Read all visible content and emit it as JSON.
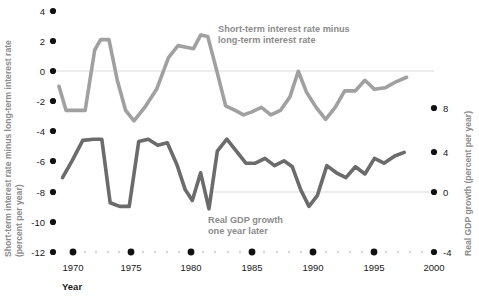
{
  "chart_data": {
    "type": "line",
    "title": "",
    "xlabel": "Year",
    "ylabel_left": "Short-term interest rate minus long-term interest rate (percent per year)",
    "ylabel_right": "Real GDP growth (percent per year)",
    "xlim": [
      1968.5,
      2000.5
    ],
    "xticks": [
      1970,
      1975,
      1980,
      1985,
      1990,
      1995,
      2000
    ],
    "xtick_labels": [
      "1970",
      "1975",
      "1980",
      "1985",
      "1990",
      "1995",
      "2000"
    ],
    "yticks_left": [
      4,
      2,
      0,
      -2,
      -4,
      -6,
      -8,
      -10,
      -12
    ],
    "ytick_labels_left": [
      "4",
      "2",
      "0",
      "-2",
      "-4",
      "-6",
      "-8",
      "-10",
      "-12"
    ],
    "ylim_left": [
      -12,
      4
    ],
    "yticks_right": [
      8,
      4,
      0,
      -4
    ],
    "ytick_labels_right": [
      "8",
      "4",
      "0",
      "-4"
    ],
    "ylim_right": [
      -4,
      8
    ],
    "grid": false,
    "zero_lines": [
      0,
      -8
    ],
    "legend_position": "inline-annotation",
    "series": [
      {
        "name": "Short-term interest rate minus long-term interest rate",
        "axis": "left",
        "color": "#a0a0a0",
        "x": [
          1969.0,
          1969.6,
          1970.4,
          1971.2,
          1972.0,
          1972.5,
          1973.2,
          1973.9,
          1974.6,
          1975.3,
          1976.2,
          1977.2,
          1978.2,
          1979.0,
          1979.7,
          1980.3,
          1980.9,
          1981.5,
          1982.2,
          1983.0,
          1983.8,
          1984.5,
          1985.2,
          1986.0,
          1986.8,
          1987.6,
          1988.4,
          1989.1,
          1989.8,
          1990.6,
          1991.4,
          1992.2,
          1993.0,
          1993.9,
          1994.7,
          1995.5,
          1996.4,
          1997.3,
          1998.2
        ],
        "y": [
          -1.0,
          -2.6,
          -2.6,
          -2.6,
          1.4,
          2.1,
          2.1,
          -0.6,
          -2.6,
          -3.3,
          -2.4,
          -1.2,
          0.9,
          1.7,
          1.6,
          1.5,
          2.4,
          2.3,
          0.2,
          -2.3,
          -2.6,
          -2.9,
          -2.7,
          -2.4,
          -2.9,
          -2.6,
          -1.7,
          0.0,
          -1.4,
          -2.4,
          -3.2,
          -2.4,
          -1.3,
          -1.3,
          -0.6,
          -1.2,
          -1.1,
          -0.7,
          -0.4
        ]
      },
      {
        "name": "Real GDP growth one year later",
        "axis": "right",
        "color": "#6b6b6b",
        "x": [
          1969.3,
          1970.1,
          1971.0,
          1971.9,
          1972.6,
          1973.3,
          1974.1,
          1974.9,
          1975.7,
          1976.5,
          1977.3,
          1978.1,
          1978.9,
          1979.6,
          1980.2,
          1980.9,
          1981.6,
          1982.3,
          1983.1,
          1983.9,
          1984.7,
          1985.5,
          1986.3,
          1987.1,
          1987.9,
          1988.6,
          1989.3,
          1990.0,
          1990.7,
          1991.5,
          1992.3,
          1993.1,
          1993.9,
          1994.7,
          1995.5,
          1996.3,
          1997.2,
          1998.0
        ],
        "y": [
          2.2,
          3.6,
          5.3,
          5.4,
          5.4,
          0.1,
          -0.2,
          -0.2,
          5.2,
          5.4,
          4.9,
          5.1,
          3.3,
          1.2,
          0.3,
          2.6,
          -0.4,
          4.4,
          5.4,
          4.4,
          3.4,
          3.4,
          3.8,
          3.2,
          3.6,
          3.1,
          1.2,
          -0.2,
          0.7,
          3.2,
          2.6,
          2.2,
          3.1,
          2.5,
          3.8,
          3.4,
          4.0,
          4.3
        ]
      }
    ],
    "annotations": [
      {
        "name": "annotation-interest-spread",
        "line1": "Short-term interest rate minus",
        "line2": "long-term interest rate"
      },
      {
        "name": "annotation-gdp-growth",
        "line1": "Real GDP growth",
        "line2": "one year later"
      }
    ]
  },
  "axes": {
    "x_axis_label": "Year",
    "y_left_label_line1": "Short-term interest rate minus long-term interest rate",
    "y_left_label_line2": "(percent per year)",
    "y_right_label": "Real GDP growth (percent per year)"
  },
  "footnote": ""
}
